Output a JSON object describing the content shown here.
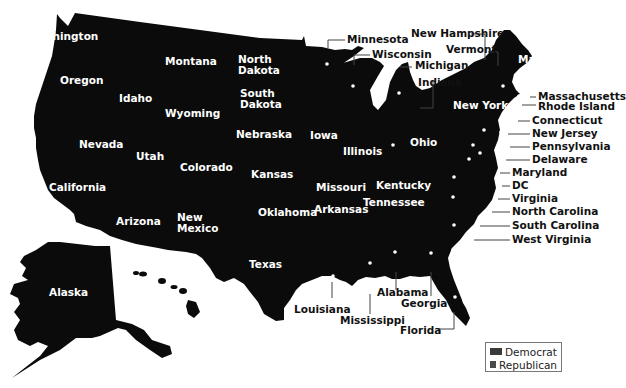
{
  "map": {
    "fill_color": "#0b0b0b",
    "label_color_inside": "#ffffff",
    "label_color_outside": "#111111",
    "states_inside": [
      {
        "name": "Washington",
        "x": 28,
        "y": 31
      },
      {
        "name": "Oregon",
        "x": 60,
        "y": 75
      },
      {
        "name": "Idaho",
        "x": 119,
        "y": 93
      },
      {
        "name": "Montana",
        "x": 165,
        "y": 56
      },
      {
        "name": "Wyoming",
        "x": 165,
        "y": 108
      },
      {
        "name": "North Dakota",
        "x": 238,
        "y": 54
      },
      {
        "name": "South Dakota",
        "x": 240,
        "y": 88
      },
      {
        "name": "Nebraska",
        "x": 236,
        "y": 129
      },
      {
        "name": "Nevada",
        "x": 79,
        "y": 139
      },
      {
        "name": "Utah",
        "x": 136,
        "y": 151
      },
      {
        "name": "Colorado",
        "x": 180,
        "y": 162
      },
      {
        "name": "Kansas",
        "x": 251,
        "y": 169
      },
      {
        "name": "California",
        "x": 49,
        "y": 182
      },
      {
        "name": "Arizona",
        "x": 116,
        "y": 216
      },
      {
        "name": "New Mexico",
        "x": 177,
        "y": 212
      },
      {
        "name": "Oklahoma",
        "x": 258,
        "y": 207
      },
      {
        "name": "Texas",
        "x": 249,
        "y": 259
      },
      {
        "name": "Iowa",
        "x": 310,
        "y": 130
      },
      {
        "name": "Illinois",
        "x": 343,
        "y": 146
      },
      {
        "name": "Missouri",
        "x": 316,
        "y": 182
      },
      {
        "name": "Kentucky",
        "x": 376,
        "y": 180
      },
      {
        "name": "Ohio",
        "x": 410,
        "y": 137
      },
      {
        "name": "Arkansas",
        "x": 314,
        "y": 204
      },
      {
        "name": "Tennessee",
        "x": 363,
        "y": 197
      },
      {
        "name": "New York",
        "x": 453,
        "y": 100
      },
      {
        "name": "Maine",
        "x": 518,
        "y": 54
      },
      {
        "name": "Alaska",
        "x": 49,
        "y": 287
      },
      {
        "name": "Hawaii",
        "x": 145,
        "y": 305
      }
    ],
    "states_outside": [
      {
        "name": "Minnesota",
        "x": 347,
        "y": 34
      },
      {
        "name": "Wisconsin",
        "x": 372,
        "y": 49
      },
      {
        "name": "Michigan",
        "x": 415,
        "y": 60
      },
      {
        "name": "Indiana",
        "x": 418,
        "y": 77
      },
      {
        "name": "New Hampshire",
        "x": 411,
        "y": 28
      },
      {
        "name": "Vermont",
        "x": 446,
        "y": 44
      },
      {
        "name": "Massachusetts",
        "x": 538,
        "y": 91
      },
      {
        "name": "Rhode Island",
        "x": 538,
        "y": 101
      },
      {
        "name": "Connecticut",
        "x": 532,
        "y": 115
      },
      {
        "name": "New Jersey",
        "x": 532,
        "y": 128
      },
      {
        "name": "Pennsylvania",
        "x": 532,
        "y": 141
      },
      {
        "name": "Delaware",
        "x": 532,
        "y": 154
      },
      {
        "name": "Maryland",
        "x": 512,
        "y": 167
      },
      {
        "name": "DC",
        "x": 512,
        "y": 180
      },
      {
        "name": "Virginia",
        "x": 512,
        "y": 193
      },
      {
        "name": "North Carolina",
        "x": 512,
        "y": 206
      },
      {
        "name": "South Carolina",
        "x": 512,
        "y": 220
      },
      {
        "name": "West Virginia",
        "x": 512,
        "y": 234
      },
      {
        "name": "Louisiana",
        "x": 294,
        "y": 304
      },
      {
        "name": "Mississippi",
        "x": 340,
        "y": 315
      },
      {
        "name": "Alabama",
        "x": 377,
        "y": 287
      },
      {
        "name": "Georgia",
        "x": 401,
        "y": 298
      },
      {
        "name": "Florida",
        "x": 400,
        "y": 325
      }
    ]
  },
  "legend": {
    "items": [
      {
        "label": "Democrat",
        "color": "#3a3a3a"
      },
      {
        "label": "Republican",
        "color": "#4a4a4a"
      }
    ]
  }
}
